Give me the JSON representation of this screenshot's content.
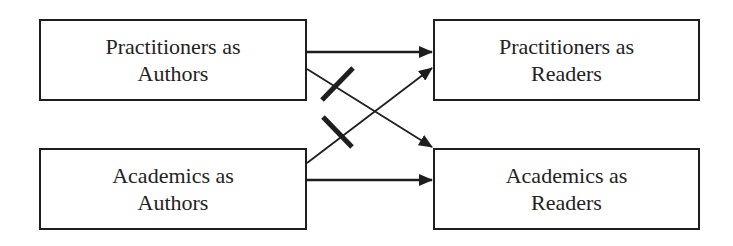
{
  "diagram": {
    "nodes": [
      {
        "id": "pa",
        "line1": "Practitioners as",
        "line2": "Authors"
      },
      {
        "id": "pr",
        "line1": "Practitioners as",
        "line2": "Readers"
      },
      {
        "id": "aa",
        "line1": "Academics as",
        "line2": "Authors"
      },
      {
        "id": "ar",
        "line1": "Academics as",
        "line2": "Readers"
      }
    ],
    "edges": [
      {
        "from": "pa",
        "to": "pr",
        "blocked": false
      },
      {
        "from": "pa",
        "to": "ar",
        "blocked": true
      },
      {
        "from": "aa",
        "to": "pr",
        "blocked": true
      },
      {
        "from": "aa",
        "to": "ar",
        "blocked": false
      }
    ],
    "colors": {
      "line": "#1e1e1e",
      "background": "#ffffff"
    }
  }
}
